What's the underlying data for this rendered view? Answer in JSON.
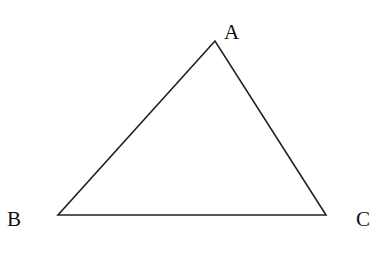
{
  "diagram": {
    "type": "triangle",
    "stroke_color": "#222222",
    "background": "#ffffff",
    "vertices": [
      {
        "label": "A",
        "x": 215,
        "y": 41,
        "label_x": 224,
        "label_y": 39
      },
      {
        "label": "B",
        "x": 58,
        "y": 215,
        "label_x": 7,
        "label_y": 226
      },
      {
        "label": "C",
        "x": 326,
        "y": 215,
        "label_x": 356,
        "label_y": 226
      }
    ],
    "edges": [
      [
        "A",
        "B"
      ],
      [
        "B",
        "C"
      ],
      [
        "C",
        "A"
      ]
    ]
  }
}
